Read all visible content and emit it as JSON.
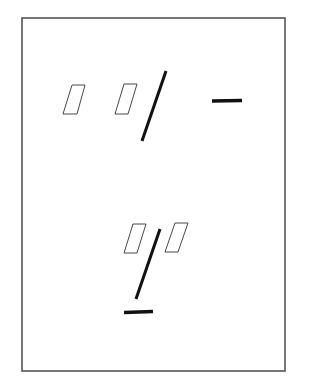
{
  "diagram": {
    "background": "#ffffff",
    "frame": {
      "x1": 22,
      "y1": 18,
      "x2": 285,
      "y2": 371,
      "stroke": "#555555",
      "stroke_width": 1.6
    },
    "groups": [
      {
        "name": "top-group",
        "elements": [
          {
            "type": "parallelogram",
            "name": "parallelogram-1",
            "points": "72,85 85,85 77,114 63,114",
            "fill": "none",
            "stroke": "#333333",
            "stroke_width": 0.9
          },
          {
            "type": "parallelogram",
            "name": "parallelogram-2",
            "points": "124,84 137,84 128,114 115,114",
            "fill": "none",
            "stroke": "#333333",
            "stroke_width": 0.9
          },
          {
            "type": "line",
            "name": "slanted-bar",
            "x1": 166,
            "y1": 71,
            "x2": 142,
            "y2": 141,
            "stroke": "#111111",
            "stroke_width": 3
          },
          {
            "type": "line",
            "name": "horizontal-bar",
            "x1": 212,
            "y1": 101,
            "x2": 242,
            "y2": 100.5,
            "stroke": "#111111",
            "stroke_width": 3.6
          }
        ]
      },
      {
        "name": "bottom-group",
        "elements": [
          {
            "type": "parallelogram",
            "name": "parallelogram-3",
            "points": "133,224 146,224 137,253 124,253",
            "fill": "none",
            "stroke": "#333333",
            "stroke_width": 0.9
          },
          {
            "type": "parallelogram",
            "name": "parallelogram-4",
            "points": "175,223 188,223 178,252 165,252",
            "fill": "none",
            "stroke": "#333333",
            "stroke_width": 0.9
          },
          {
            "type": "line",
            "name": "slanted-bar",
            "x1": 160,
            "y1": 229,
            "x2": 136,
            "y2": 299,
            "stroke": "#111111",
            "stroke_width": 3
          },
          {
            "type": "line",
            "name": "horizontal-bar",
            "x1": 124,
            "y1": 312.5,
            "x2": 153,
            "y2": 311.5,
            "stroke": "#111111",
            "stroke_width": 3.6
          }
        ]
      }
    ]
  }
}
